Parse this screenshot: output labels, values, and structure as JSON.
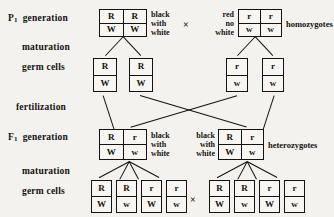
{
  "diagram": {
    "cross_symbol": "×"
  },
  "stage_labels": {
    "p1_generation_prefix": "P",
    "p1_generation_sub": "1",
    "p1_generation_word": "generation",
    "maturation_p1": "maturation",
    "germ_cells_p1": "germ cells",
    "fertilization": "fertilization",
    "f1_generation_prefix": "F",
    "f1_generation_sub": "1",
    "f1_generation_word": "generation",
    "maturation_f1": "maturation",
    "germ_cells_f1": "germ cells"
  },
  "phenotypes": {
    "p1_left_line1": "black",
    "p1_left_line2": "with",
    "p1_left_line3": "white",
    "p1_right_line1": "red",
    "p1_right_line2": "no",
    "p1_right_line3": "white",
    "p1_right_zygosity": "homozygotes",
    "f1_left_line1": "black",
    "f1_left_line2": "with",
    "f1_left_line3": "white",
    "f1_right_line1": "black",
    "f1_right_line2": "with",
    "f1_right_line3": "white",
    "f1_right_zygosity": "heterozygotes"
  },
  "genotypes": {
    "p1_parent_left": {
      "top": [
        "R",
        "R"
      ],
      "bottom": [
        "W",
        "W"
      ]
    },
    "p1_parent_right": {
      "top": [
        "r",
        "r"
      ],
      "bottom": [
        "w",
        "w"
      ]
    },
    "p1_germ_left_a": {
      "top": [
        "R"
      ],
      "bottom": [
        "W"
      ]
    },
    "p1_germ_left_b": {
      "top": [
        "R"
      ],
      "bottom": [
        "W"
      ]
    },
    "p1_germ_right_a": {
      "top": [
        "r"
      ],
      "bottom": [
        "w"
      ]
    },
    "p1_germ_right_b": {
      "top": [
        "r"
      ],
      "bottom": [
        "w"
      ]
    },
    "f1_offspring_left": {
      "top": [
        "R",
        "r"
      ],
      "bottom": [
        "W",
        "w"
      ]
    },
    "f1_offspring_right": {
      "top": [
        "R",
        "r"
      ],
      "bottom": [
        "W",
        "w"
      ]
    },
    "f1_germ_left": [
      {
        "top": [
          "R"
        ],
        "bottom": [
          "W"
        ]
      },
      {
        "top": [
          "R"
        ],
        "bottom": [
          "w"
        ]
      },
      {
        "top": [
          "r"
        ],
        "bottom": [
          "W"
        ]
      },
      {
        "top": [
          "r"
        ],
        "bottom": [
          "w"
        ]
      }
    ],
    "f1_germ_right": [
      {
        "top": [
          "R"
        ],
        "bottom": [
          "W"
        ]
      },
      {
        "top": [
          "R"
        ],
        "bottom": [
          "w"
        ]
      },
      {
        "top": [
          "r"
        ],
        "bottom": [
          "W"
        ]
      },
      {
        "top": [
          "r"
        ],
        "bottom": [
          "w"
        ]
      }
    ]
  },
  "colors": {
    "background": "#f3f2ee",
    "ink": "#15120f",
    "box_fill": "#f7f6f2"
  }
}
